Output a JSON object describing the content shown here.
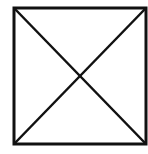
{
  "diagram": {
    "shape": "square-with-diagonals",
    "stroke_color": "#111111",
    "background_color": "#ffffff",
    "square": {
      "x1": 14,
      "y1": 8,
      "x2": 146,
      "y2": 144
    },
    "diagonals": [
      {
        "from": "top-left",
        "to": "bottom-right"
      },
      {
        "from": "top-right",
        "to": "bottom-left"
      }
    ]
  }
}
